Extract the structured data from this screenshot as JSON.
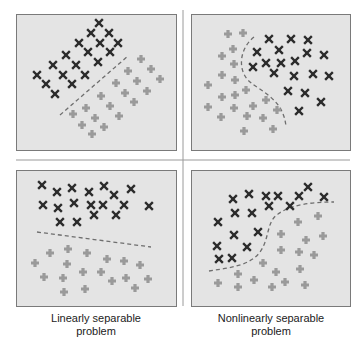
{
  "colors": {
    "panel_fill": "#e4e4e4",
    "panel_border": "#7a7a7a",
    "divider": "#9a9a9a",
    "class_x": "#2b2b2b",
    "class_plus": "#9a9a9a",
    "boundary": "#6e6e6e"
  },
  "dividers": {
    "vertical": {
      "x": 183,
      "y1": 10,
      "y2": 306
    },
    "horizontal": {
      "x1": 16,
      "x2": 350,
      "y": 160
    }
  },
  "panels": [
    {
      "id": "top-left",
      "title": "Linearly separable (diagonal)",
      "rect": [
        16,
        14,
        160,
        136
      ],
      "x_points": [
        [
          99,
          23
        ],
        [
          91,
          33
        ],
        [
          109,
          33
        ],
        [
          79,
          43
        ],
        [
          100,
          43
        ],
        [
          118,
          43
        ],
        [
          66,
          55
        ],
        [
          88,
          52
        ],
        [
          110,
          52
        ],
        [
          53,
          65
        ],
        [
          76,
          65
        ],
        [
          98,
          62
        ],
        [
          37,
          75
        ],
        [
          63,
          75
        ],
        [
          85,
          75
        ],
        [
          46,
          84
        ],
        [
          72,
          84
        ],
        [
          55,
          94
        ]
      ],
      "plus_points": [
        [
          141,
          59
        ],
        [
          128,
          71
        ],
        [
          151,
          69
        ],
        [
          116,
          83
        ],
        [
          137,
          81
        ],
        [
          160,
          79
        ],
        [
          101,
          96
        ],
        [
          125,
          93
        ],
        [
          147,
          91
        ],
        [
          86,
          108
        ],
        [
          110,
          106
        ],
        [
          134,
          102
        ],
        [
          73,
          114
        ],
        [
          95,
          118
        ],
        [
          119,
          116
        ],
        [
          82,
          125
        ],
        [
          104,
          127
        ],
        [
          92,
          134
        ]
      ],
      "boundary": "M60,115 L128,56"
    },
    {
      "id": "top-right",
      "title": "Nonlinearly separable (curved)",
      "rect": [
        191,
        14,
        159,
        136
      ],
      "x_points": [
        [
          269,
          39
        ],
        [
          291,
          39
        ],
        [
          308,
          40
        ],
        [
          257,
          52
        ],
        [
          279,
          50
        ],
        [
          307,
          53
        ],
        [
          324,
          55
        ],
        [
          266,
          63
        ],
        [
          281,
          63
        ],
        [
          295,
          61
        ],
        [
          253,
          67
        ],
        [
          274,
          73
        ],
        [
          294,
          76
        ],
        [
          313,
          74
        ],
        [
          329,
          76
        ],
        [
          288,
          91
        ],
        [
          305,
          93
        ],
        [
          321,
          102
        ],
        [
          299,
          111
        ]
      ],
      "plus_points": [
        [
          228,
          34
        ],
        [
          243,
          33
        ],
        [
          233,
          49
        ],
        [
          222,
          56
        ],
        [
          234,
          64
        ],
        [
          222,
          75
        ],
        [
          235,
          80
        ],
        [
          208,
          85
        ],
        [
          246,
          90
        ],
        [
          222,
          97
        ],
        [
          235,
          95
        ],
        [
          266,
          100
        ],
        [
          208,
          107
        ],
        [
          234,
          108
        ],
        [
          253,
          106
        ],
        [
          277,
          110
        ],
        [
          221,
          117
        ],
        [
          247,
          116
        ],
        [
          263,
          118
        ],
        [
          244,
          131
        ],
        [
          273,
          129
        ]
      ],
      "boundary": "M254,37 C238,50 238,72 250,82 C262,92 284,100 286,127"
    },
    {
      "id": "bottom-left",
      "title": "Linearly separable (horizontal)",
      "rect": [
        16,
        170,
        160,
        136
      ],
      "x_points": [
        [
          42,
          185
        ],
        [
          57,
          192
        ],
        [
          72,
          188
        ],
        [
          89,
          192
        ],
        [
          104,
          186
        ],
        [
          114,
          195
        ],
        [
          131,
          189
        ],
        [
          43,
          205
        ],
        [
          58,
          208
        ],
        [
          74,
          203
        ],
        [
          91,
          205
        ],
        [
          103,
          205
        ],
        [
          124,
          205
        ],
        [
          149,
          206
        ],
        [
          94,
          215
        ],
        [
          116,
          215
        ],
        [
          60,
          222
        ],
        [
          77,
          222
        ]
      ],
      "plus_points": [
        [
          68,
          249
        ],
        [
          50,
          253
        ],
        [
          87,
          253
        ],
        [
          107,
          259
        ],
        [
          124,
          261
        ],
        [
          35,
          263
        ],
        [
          67,
          264
        ],
        [
          140,
          265
        ],
        [
          83,
          272
        ],
        [
          101,
          272
        ],
        [
          44,
          277
        ],
        [
          63,
          278
        ],
        [
          112,
          281
        ],
        [
          126,
          278
        ],
        [
          148,
          279
        ],
        [
          135,
          288
        ],
        [
          64,
          292
        ],
        [
          85,
          289
        ]
      ],
      "boundary": "M37,232 L151,247"
    },
    {
      "id": "bottom-right",
      "title": "Nonlinearly separable (S-curve)",
      "rect": [
        191,
        170,
        159,
        136
      ],
      "x_points": [
        [
          308,
          187
        ],
        [
          249,
          194
        ],
        [
          266,
          196
        ],
        [
          278,
          196
        ],
        [
          299,
          196
        ],
        [
          324,
          197
        ],
        [
          233,
          199
        ],
        [
          269,
          206
        ],
        [
          290,
          206
        ],
        [
          235,
          213
        ],
        [
          252,
          213
        ],
        [
          218,
          222
        ],
        [
          258,
          232
        ],
        [
          234,
          235
        ],
        [
          217,
          246
        ],
        [
          247,
          247
        ],
        [
          219,
          259
        ],
        [
          232,
          258
        ]
      ],
      "plus_points": [
        [
          318,
          216
        ],
        [
          298,
          222
        ],
        [
          281,
          234
        ],
        [
          323,
          236
        ],
        [
          306,
          240
        ],
        [
          281,
          250
        ],
        [
          299,
          252
        ],
        [
          314,
          255
        ],
        [
          263,
          263
        ],
        [
          300,
          269
        ],
        [
          238,
          274
        ],
        [
          276,
          272
        ],
        [
          218,
          283
        ],
        [
          254,
          280
        ],
        [
          285,
          282
        ],
        [
          305,
          285
        ],
        [
          238,
          287
        ],
        [
          272,
          287
        ]
      ],
      "boundary": "M209,271 C228,268 250,266 260,252 C270,238 266,222 278,214 C292,204 314,202 334,202"
    }
  ],
  "captions": [
    {
      "line1": "Linearly separable",
      "line2": "problem",
      "center_x": 96
    },
    {
      "line1": "Nonlinearly separable",
      "line2": "problem",
      "center_x": 271
    }
  ]
}
